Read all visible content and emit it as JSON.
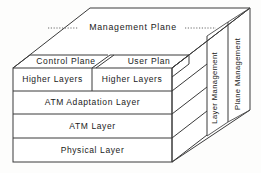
{
  "diagram": {
    "top_face": {
      "label": "Management Plane",
      "leader_style": "dotted"
    },
    "right_face": {
      "panels": [
        {
          "label": "Layer Management"
        },
        {
          "label": "Plane Management"
        }
      ]
    },
    "front_face": {
      "plane_row": [
        {
          "label": "Control Plane"
        },
        {
          "label": "User Plan"
        }
      ],
      "split_row": [
        {
          "label": "Higher Layers"
        },
        {
          "label": "Higher Layers"
        }
      ],
      "full_rows": [
        {
          "label": "ATM Adaptation Layer"
        },
        {
          "label": "ATM Layer"
        },
        {
          "label": "Physical Layer"
        }
      ]
    },
    "colors": {
      "line": "#3a3a3a",
      "background": "#fdfdfc",
      "face": "#ffffff",
      "text": "#1a1a1a"
    }
  }
}
